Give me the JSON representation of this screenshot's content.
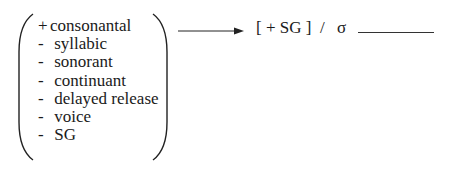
{
  "rule": {
    "input_features": [
      {
        "sign": "+",
        "feature": "consonantal"
      },
      {
        "sign": "-",
        "feature": "syllabic"
      },
      {
        "sign": "-",
        "feature": "sonorant"
      },
      {
        "sign": "-",
        "feature": "continuant"
      },
      {
        "sign": "-",
        "feature": "delayed release"
      },
      {
        "sign": "-",
        "feature": "voice"
      },
      {
        "sign": "-",
        "feature": "SG"
      }
    ],
    "arrow_icon": "right-arrow",
    "output": "[ + SG ]",
    "environment_slash": "/",
    "environment_context": "σ",
    "focus_blank": "____"
  }
}
